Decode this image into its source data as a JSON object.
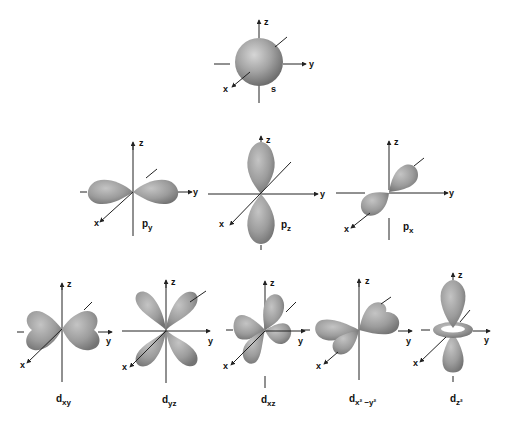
{
  "diagram": {
    "colors": {
      "background": "#ffffff",
      "lobe_light": "#c9c9c9",
      "lobe_mid": "#9a9a9a",
      "lobe_dark": "#6f6f6f",
      "axis": "#222222",
      "label": "#111111"
    },
    "axis_labels": {
      "x": "x",
      "y": "y",
      "z": "z"
    },
    "rows": [
      {
        "name": "s-orbital-row",
        "orbitals": [
          {
            "id": "s",
            "label_main": "s",
            "label_sub": "",
            "label_sup": ""
          }
        ]
      },
      {
        "name": "p-orbital-row",
        "orbitals": [
          {
            "id": "py",
            "label_main": "p",
            "label_sub": "y",
            "label_sup": ""
          },
          {
            "id": "pz",
            "label_main": "p",
            "label_sub": "z",
            "label_sup": ""
          },
          {
            "id": "px",
            "label_main": "p",
            "label_sub": "x",
            "label_sup": ""
          }
        ]
      },
      {
        "name": "d-orbital-row",
        "orbitals": [
          {
            "id": "dxy",
            "label_main": "d",
            "label_sub": "xy",
            "label_sup": ""
          },
          {
            "id": "dyz",
            "label_main": "d",
            "label_sub": "yz",
            "label_sup": ""
          },
          {
            "id": "dxz",
            "label_main": "d",
            "label_sub": "xz",
            "label_sup": ""
          },
          {
            "id": "dx2y2",
            "label_main": "d",
            "label_sub": "x² −y²",
            "label_sup": ""
          },
          {
            "id": "dz2",
            "label_main": "d",
            "label_sub": "z²",
            "label_sup": ""
          }
        ]
      }
    ]
  }
}
